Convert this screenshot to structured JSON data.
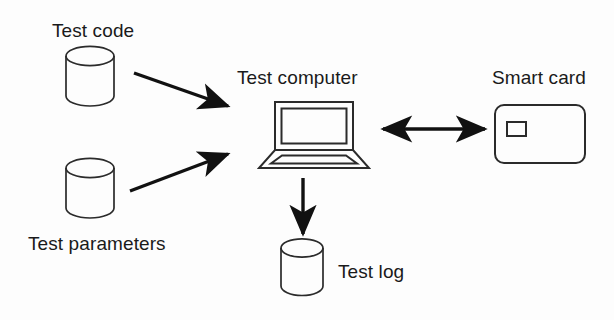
{
  "diagram": {
    "background_color": "#fdfdfd",
    "stroke_color": "#1a1a1a",
    "arrow_color": "#111111",
    "nodes": [
      {
        "id": "test-code",
        "label": "Test code",
        "shape": "cylinder-database",
        "label_position": "above"
      },
      {
        "id": "test-parameters",
        "label": "Test parameters",
        "shape": "cylinder-database",
        "label_position": "below"
      },
      {
        "id": "test-computer",
        "label": "Test computer",
        "shape": "laptop",
        "label_position": "above"
      },
      {
        "id": "smart-card",
        "label": "Smart card",
        "shape": "card-with-chip",
        "label_position": "above"
      },
      {
        "id": "test-log",
        "label": "Test log",
        "shape": "cylinder-database",
        "label_position": "right"
      }
    ],
    "edges": [
      {
        "id": "code-to-computer",
        "from": "test-code",
        "to": "test-computer",
        "direction": "one-way"
      },
      {
        "id": "parameters-to-computer",
        "from": "test-parameters",
        "to": "test-computer",
        "direction": "one-way"
      },
      {
        "id": "computer-to-card",
        "from": "test-computer",
        "to": "smart-card",
        "direction": "bidirectional"
      },
      {
        "id": "computer-to-log",
        "from": "test-computer",
        "to": "test-log",
        "direction": "one-way"
      }
    ]
  }
}
